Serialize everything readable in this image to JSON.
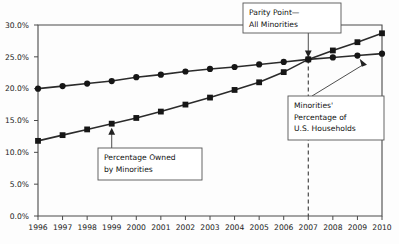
{
  "chart_data": {
    "type": "line",
    "title": "",
    "xlabel": "",
    "ylabel": "",
    "grid": false,
    "legend_position": "none",
    "x": [
      1996,
      1997,
      1998,
      1999,
      2000,
      2001,
      2002,
      2003,
      2004,
      2005,
      2006,
      2007,
      2008,
      2009,
      2010
    ],
    "categories": [
      "1996",
      "1997",
      "1998",
      "1999",
      "2000",
      "2001",
      "2002",
      "2003",
      "2004",
      "2005",
      "2006",
      "2007",
      "2008",
      "2009",
      "2010"
    ],
    "ylim": [
      0.0,
      30.0
    ],
    "xlim": [
      1996,
      2010
    ],
    "yticks": [
      0.0,
      5.0,
      10.0,
      15.0,
      20.0,
      25.0,
      30.0
    ],
    "ytick_labels": [
      "0.0%",
      "5.0%",
      "10.0%",
      "15.0%",
      "20.0%",
      "25.0%",
      "30.0%"
    ],
    "series": [
      {
        "name": "Minorities' Percentage of U.S. Households",
        "marker": "circle",
        "values": [
          20.0,
          20.4,
          20.8,
          21.2,
          21.8,
          22.2,
          22.7,
          23.1,
          23.4,
          23.8,
          24.2,
          24.6,
          24.9,
          25.2,
          25.5
        ]
      },
      {
        "name": "Percentage Owned by Minorities",
        "marker": "square",
        "values": [
          11.8,
          12.7,
          13.6,
          14.5,
          15.4,
          16.4,
          17.5,
          18.6,
          19.8,
          21.0,
          22.6,
          24.6,
          26.0,
          27.3,
          28.7
        ]
      }
    ],
    "annotations": [
      {
        "id": "parity-point",
        "lines": [
          "Parity Point—",
          "All Minorities"
        ],
        "target_x": 2007,
        "target_y": 24.6
      },
      {
        "id": "minorities-households",
        "lines": [
          "Minorities'",
          "Percentage of",
          "U.S. Households"
        ],
        "target_x": 2009,
        "target_y": 25.2
      },
      {
        "id": "percentage-owned",
        "lines": [
          "Percentage Owned",
          "by Minorities"
        ],
        "target_x": 1999,
        "target_y": 14.5
      }
    ],
    "parity_line": {
      "x": 2007,
      "style": "dashed"
    }
  }
}
